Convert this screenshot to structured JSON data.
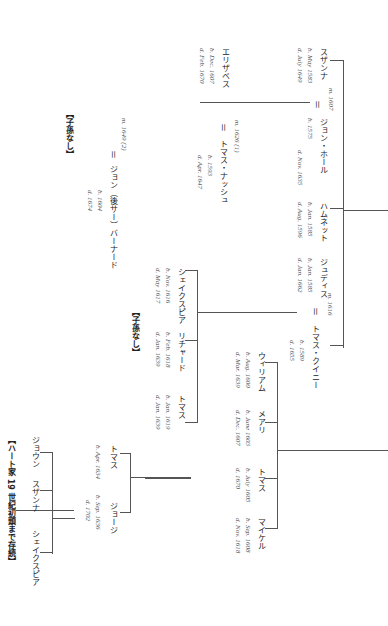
{
  "persons": {
    "susanna": {
      "name": "スザンナ",
      "born": "b. May 1583",
      "died": "d. July 1649"
    },
    "john_hall": {
      "name": "ジョン・ホール",
      "born": "b. 1575",
      "died": "d. Nov. 1635"
    },
    "m_susanna": "m. 1607",
    "hamnet": {
      "name": "ハムネット",
      "born": "b. Jan. 1585",
      "died": "d. Aug. 1596"
    },
    "judith": {
      "name": "ジュディス",
      "born": "b. Jan. 1585",
      "died": "d. Jan. 1662"
    },
    "thomas_quiney": {
      "name": "トマス・クイニー",
      "born": "b. 1589",
      "died": "d. 1655"
    },
    "m_judith": "m. 1616",
    "elizabeth": {
      "name": "エリザベス",
      "born": "b. Dec. 1607",
      "died": "d. Feb. 1670"
    },
    "thomas_nash": {
      "name": "トマス・ナッシュ",
      "born": "b. 1593",
      "died": "d. Apr. 1647"
    },
    "m_nash": "m. 1626 (1)",
    "john_barnard": {
      "name": "ジョン（後サー）バーナード",
      "born": "b. 1604",
      "died": "d. 1674"
    },
    "m_barnard": "m. 1649 (2)",
    "shakespeare_q": {
      "name": "シェイクスピア",
      "born": "b. Nov. 1616",
      "died": "d. May 1617"
    },
    "richard": {
      "name": "リチャード",
      "born": "b. Feb. 1618",
      "died": "d. Jan. 1639"
    },
    "thomas_q": {
      "name": "トマス",
      "born": "b. Jan. 1619",
      "died": "d. Jan. 1639"
    },
    "william": {
      "name": "ウィリアム",
      "born": "b. Aug. 1600",
      "died": "d. Mar. 1639"
    },
    "mary": {
      "name": "メアリ",
      "born": "b. June 1603",
      "died": "d. Dec. 1607"
    },
    "thomas_h": {
      "name": "トマス",
      "born": "b. July 1605",
      "died": "d. 1670"
    },
    "michael": {
      "name": "マイケル",
      "born": "b. Sep. 1608",
      "died": "d. Nov. 1618"
    },
    "thomas_h2": {
      "name": "トマス",
      "born": "b. Apr. 1634",
      "died": ""
    },
    "george": {
      "name": "ジョージ",
      "born": "b. Sep. 1636",
      "died": "d. 1702"
    },
    "joan": {
      "name": "ジョウン"
    },
    "susanna2": {
      "name": "スザンナ"
    },
    "shakespeare_h": {
      "name": "シェイクスピア"
    }
  },
  "notes": {
    "no_issue_1": "【子孫なし】",
    "no_issue_2": "【子孫なし】",
    "hart_family": "【ハート家 19 世紀初頭まで存続】"
  },
  "symbols": {
    "married": "＝"
  }
}
